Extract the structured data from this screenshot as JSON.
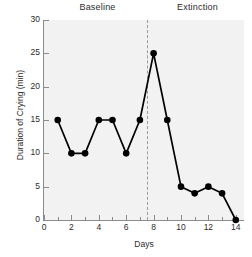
{
  "chart_data": {
    "type": "line",
    "title": "",
    "xlabel": "Days",
    "ylabel": "Duration of Crying (min)",
    "xlim": [
      0,
      14.6
    ],
    "ylim": [
      0,
      30
    ],
    "grid": false,
    "legend": null,
    "x": [
      1,
      2,
      3,
      4,
      5,
      6,
      7,
      8,
      9,
      10,
      11,
      12,
      13,
      14
    ],
    "values": [
      15,
      10,
      10,
      15,
      15,
      10,
      15,
      25,
      15,
      5,
      4,
      5,
      4,
      0
    ],
    "series": [
      {
        "name": "Duration of Crying",
        "x": [
          1,
          2,
          3,
          4,
          5,
          6,
          7,
          8,
          9,
          10,
          11,
          12,
          13,
          14
        ],
        "values": [
          15,
          10,
          10,
          15,
          15,
          10,
          15,
          25,
          15,
          5,
          4,
          5,
          4,
          0
        ],
        "color": "#000000",
        "marker": "circle"
      }
    ],
    "xticks": [
      0,
      2,
      4,
      6,
      8,
      10,
      12,
      14
    ],
    "xticklabels": [
      "0",
      "2",
      "4",
      "6",
      "8",
      "10",
      "12",
      "14"
    ],
    "xminorticks": [
      1,
      3,
      5,
      7,
      9,
      11,
      13
    ],
    "yticks": [
      0,
      5,
      10,
      15,
      20,
      25,
      30
    ],
    "yticklabels": [
      "0",
      "5",
      "10",
      "15",
      "20",
      "25",
      "30"
    ],
    "annotations": [
      {
        "name": "phase-divider",
        "type": "vline",
        "x": 7.5,
        "style": "dashed",
        "color": "#9a9a9a"
      }
    ],
    "phases": [
      {
        "label": "Baseline",
        "x_start": 0,
        "x_end": 7.5
      },
      {
        "label": "Extinction",
        "x_start": 7.5,
        "x_end": 14.6
      }
    ],
    "plot_background": "#f2f2f2",
    "axis_color": "#8c8c8c",
    "text_color": "#2b2b2b"
  }
}
